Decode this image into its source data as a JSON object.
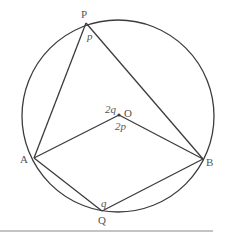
{
  "diagram": {
    "type": "circle-theorem",
    "circle": {
      "center": "O"
    },
    "points": {
      "P": {
        "label": "P"
      },
      "O": {
        "label": "O"
      },
      "A": {
        "label": "A"
      },
      "B": {
        "label": "B"
      },
      "Q": {
        "label": "Q"
      }
    },
    "angles": {
      "at_P": "p",
      "at_O_upper": "2q",
      "at_O_lower": "2p",
      "at_Q": "q"
    },
    "segments": [
      "PA",
      "PB",
      "OA",
      "OB",
      "QA",
      "QB"
    ],
    "colors": {
      "stroke": "#3c3c3c",
      "label": "#555555",
      "rule": "#8a8a8a"
    }
  }
}
